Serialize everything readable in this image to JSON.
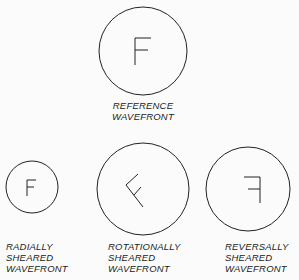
{
  "diagram": {
    "reference": {
      "glyph": "F",
      "label_line1": "REFERENCE",
      "label_line2": "WAVEFRONT"
    },
    "radial": {
      "glyph": "F",
      "label_line1": "RADIALLY",
      "label_line2": "SHEARED",
      "label_line3": "WAVEFRONT"
    },
    "rotational": {
      "glyph": "F rotated",
      "label_line1": "ROTATIONALLY",
      "label_line2": "SHEARED",
      "label_line3": "WAVEFRONT"
    },
    "reversal": {
      "glyph": "F mirrored",
      "label_line1": "REVERSALLY",
      "label_line2": "SHEARED",
      "label_line3": "WAVEFRONT"
    }
  }
}
